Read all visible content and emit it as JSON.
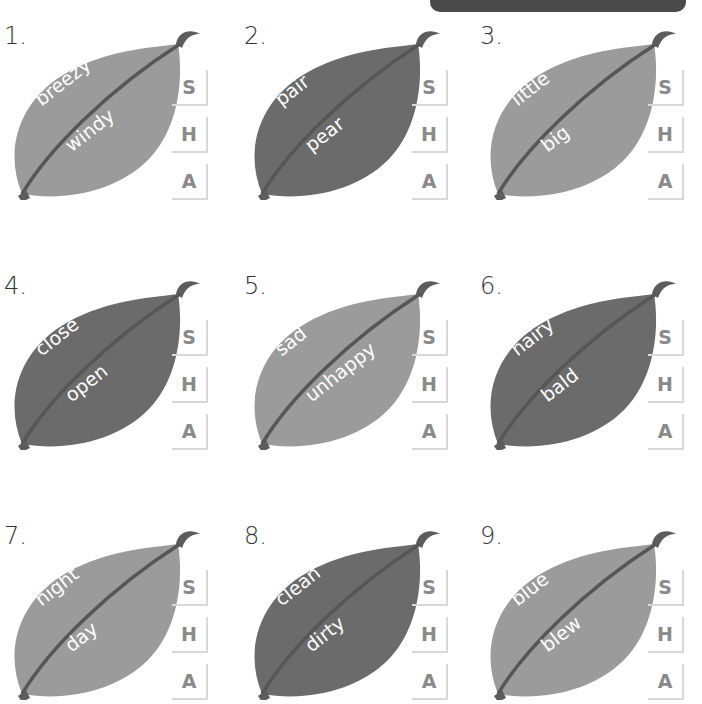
{
  "header": {
    "banner": ""
  },
  "options": [
    "S",
    "H",
    "A"
  ],
  "colors": {
    "light_leaf": "#9b9b9b",
    "dark_leaf": "#6b6b6b",
    "vein": "#565656"
  },
  "items": [
    {
      "number": "1.",
      "word1": "breezy",
      "word2": "windy",
      "shade": "light"
    },
    {
      "number": "2.",
      "word1": "pair",
      "word2": "pear",
      "shade": "dark"
    },
    {
      "number": "3.",
      "word1": "little",
      "word2": "big",
      "shade": "light"
    },
    {
      "number": "4.",
      "word1": "close",
      "word2": "open",
      "shade": "dark"
    },
    {
      "number": "5.",
      "word1": "sad",
      "word2": "unhappy",
      "shade": "light"
    },
    {
      "number": "6.",
      "word1": "hairy",
      "word2": "bald",
      "shade": "dark"
    },
    {
      "number": "7.",
      "word1": "night",
      "word2": "day",
      "shade": "light"
    },
    {
      "number": "8.",
      "word1": "clean",
      "word2": "dirty",
      "shade": "dark"
    },
    {
      "number": "9.",
      "word1": "blue",
      "word2": "blew",
      "shade": "light"
    }
  ]
}
